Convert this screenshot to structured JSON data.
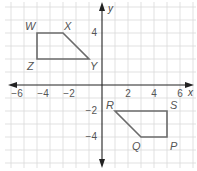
{
  "diagram": {
    "type": "coordinate-plane",
    "axes": {
      "x_label": "x",
      "y_label": "y",
      "x_range": [
        -7,
        7
      ],
      "y_range": [
        -6,
        6
      ],
      "x_ticks": [
        {
          "value": -6,
          "label": "−6"
        },
        {
          "value": -4,
          "label": "−4"
        },
        {
          "value": -2,
          "label": "−2"
        },
        {
          "value": 2,
          "label": "2"
        },
        {
          "value": 4,
          "label": "4"
        },
        {
          "value": 6,
          "label": "6"
        }
      ],
      "y_ticks": [
        {
          "value": 4,
          "label": "4"
        },
        {
          "value": -2,
          "label": "−2"
        },
        {
          "value": -4,
          "label": "−4"
        }
      ]
    },
    "figures": [
      {
        "name": "WXYZ",
        "vertices": [
          {
            "label": "W",
            "x": -5,
            "y": 4
          },
          {
            "label": "X",
            "x": -3,
            "y": 4
          },
          {
            "label": "Y",
            "x": -1,
            "y": 2
          },
          {
            "label": "Z",
            "x": -5,
            "y": 2
          }
        ]
      },
      {
        "name": "RSPQ",
        "vertices": [
          {
            "label": "R",
            "x": 1,
            "y": -2
          },
          {
            "label": "S",
            "x": 5,
            "y": -2
          },
          {
            "label": "P",
            "x": 5,
            "y": -4
          },
          {
            "label": "Q",
            "x": 3,
            "y": -4
          }
        ]
      }
    ],
    "colors": {
      "grid": "#d9d9d9",
      "axis": "#222222",
      "figure_stroke": "#6b6b6b",
      "label": "#555555"
    }
  }
}
